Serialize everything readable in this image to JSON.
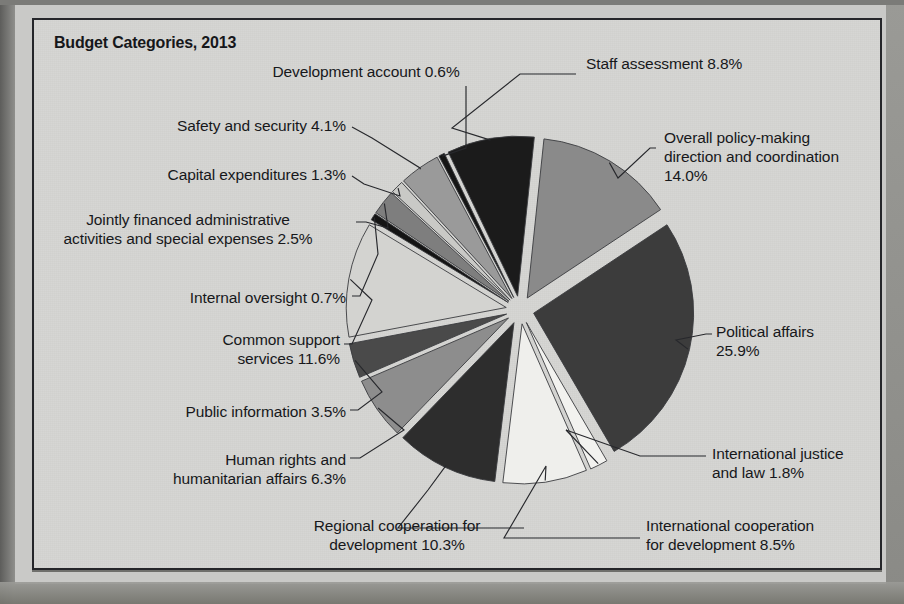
{
  "title": "Budget Categories, 2013",
  "chart_data": {
    "type": "pie",
    "title": "Budget Categories, 2013",
    "unit": "percent",
    "exploded": true,
    "legend_position": "callout-labels",
    "grid": false,
    "categories": [
      "Overall policy-making direction and coordination",
      "Political affairs",
      "International justice and law",
      "International cooperation for development",
      "Regional cooperation for development",
      "Human rights and humanitarian affairs",
      "Public information",
      "Common support services",
      "Internal oversight",
      "Jointly financed administrative activities and special expenses",
      "Capital expenditures",
      "Safety and security",
      "Development account",
      "Staff assessment"
    ],
    "values": [
      14.0,
      25.9,
      1.8,
      8.5,
      10.3,
      6.3,
      3.5,
      11.6,
      0.7,
      2.5,
      1.3,
      4.1,
      0.6,
      8.8
    ],
    "colors": [
      "#8a8a8a",
      "#3c3c3c",
      "#f2f2ef",
      "#efefec",
      "#2d2d2d",
      "#8d8d8d",
      "#4a4a4a",
      "#d3d3d0",
      "#141414",
      "#7e7e7e",
      "#c9c9c6",
      "#9a9a9a",
      "#151515",
      "#1b1b1b"
    ]
  },
  "labels": [
    {
      "text": "Development account 0.6%",
      "value": "0.6%",
      "name": "development-account"
    },
    {
      "text": "Staff assessment 8.8%",
      "value": "8.8%",
      "name": "staff-assessment"
    },
    {
      "text": "Safety and security 4.1%",
      "value": "4.1%",
      "name": "safety-and-security"
    },
    {
      "text": "Overall policy-making\ndirection and coordination\n14.0%",
      "value": "14.0%",
      "name": "overall-policy-making"
    },
    {
      "text": "Capital expenditures 1.3%",
      "value": "1.3%",
      "name": "capital-expenditures"
    },
    {
      "text": "Jointly financed administrative\nactivities and special expenses 2.5%",
      "value": "2.5%",
      "name": "jointly-financed-administrative"
    },
    {
      "text": "Internal oversight 0.7%",
      "value": "0.7%",
      "name": "internal-oversight"
    },
    {
      "text": "Political affairs\n25.9%",
      "value": "25.9%",
      "name": "political-affairs"
    },
    {
      "text": "Common support\nservices 11.6%",
      "value": "11.6%",
      "name": "common-support-services"
    },
    {
      "text": "Public information 3.5%",
      "value": "3.5%",
      "name": "public-information"
    },
    {
      "text": "International justice\nand law 1.8%",
      "value": "1.8%",
      "name": "international-justice-and-law"
    },
    {
      "text": "Human rights and\nhumanitarian affairs 6.3%",
      "value": "6.3%",
      "name": "human-rights-humanitarian"
    },
    {
      "text": "Regional cooperation for\ndevelopment 10.3%",
      "value": "10.3%",
      "name": "regional-cooperation"
    },
    {
      "text": "International cooperation\nfor development 8.5%",
      "value": "8.5%",
      "name": "international-cooperation"
    }
  ],
  "style": {
    "frame_border": "#25262a",
    "paper": "#d6d6d3",
    "text": "#17181b"
  }
}
